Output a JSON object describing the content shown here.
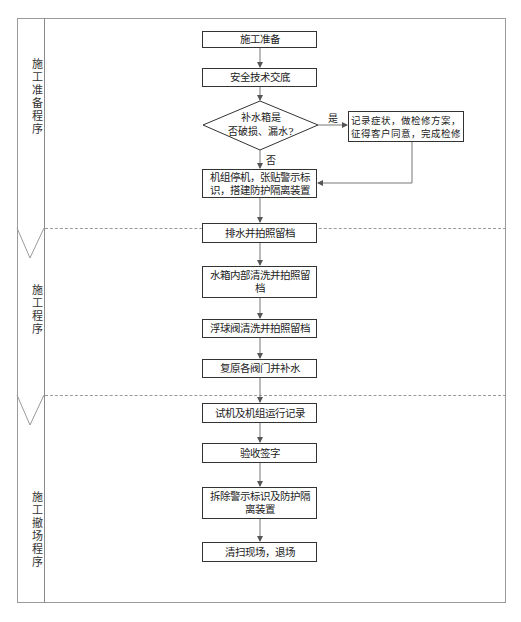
{
  "diagram": {
    "type": "swimlane-flowchart",
    "lanes": [
      {
        "label": "施工准备程序"
      },
      {
        "label": "施工程序"
      },
      {
        "label": "施工撤场程序"
      }
    ],
    "nodes": {
      "n1": "施工准备",
      "n2": "安全技术交底",
      "decision": "补水箱是否破损、漏水?",
      "decision_line1": "补水箱是",
      "decision_line2": "否破损、漏水?",
      "repair": "记录症状，做检修方案，征得客户同意，完成检修",
      "n3": "机组停机，张贴警示标识，搭建防护隔离装置",
      "n4": "排水并拍照留档",
      "n5": "水箱内部清洗并拍照留档",
      "n6": "浮球阀清洗并拍照留档",
      "n7": "复原各阀门并补水",
      "n8": "试机及机组运行记录",
      "n9": "验收签字",
      "n10": "拆除警示标识及防护隔离装置",
      "n11": "清扫现场，退场"
    },
    "edge_labels": {
      "yes": "是",
      "no": "否"
    }
  }
}
